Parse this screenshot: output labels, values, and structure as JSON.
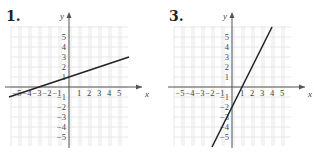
{
  "chart_data": [
    {
      "type": "line",
      "title": "1.",
      "xlabel": "x",
      "ylabel": "y",
      "xlim": [
        -6,
        6
      ],
      "ylim": [
        -6,
        6
      ],
      "grid": true,
      "x_ticks": [
        -5,
        -4,
        -3,
        -2,
        -1,
        1,
        2,
        3,
        4,
        5
      ],
      "y_ticks": [
        -5,
        -4,
        -3,
        -2,
        -1,
        1,
        2,
        3,
        4,
        5
      ],
      "series": [
        {
          "name": "line",
          "equation": "y = x/3 + 1",
          "x": [
            -6,
            6
          ],
          "y": [
            -1,
            3
          ]
        }
      ],
      "color": "#222222"
    },
    {
      "type": "line",
      "title": "3.",
      "xlabel": "x",
      "ylabel": "y",
      "xlim": [
        -6,
        6
      ],
      "ylim": [
        -6,
        6
      ],
      "grid": true,
      "x_ticks": [
        -5,
        -4,
        -3,
        -2,
        -1,
        1,
        2,
        3,
        4,
        5
      ],
      "y_ticks": [
        -5,
        -4,
        -3,
        -2,
        -1,
        1,
        2,
        3,
        4,
        5
      ],
      "series": [
        {
          "name": "line",
          "equation": "y = 2x - 2",
          "x": [
            -2,
            4
          ],
          "y": [
            -6,
            6
          ]
        }
      ],
      "color": "#222222"
    }
  ],
  "panels": [
    {
      "label": "1."
    },
    {
      "label": "3."
    }
  ]
}
